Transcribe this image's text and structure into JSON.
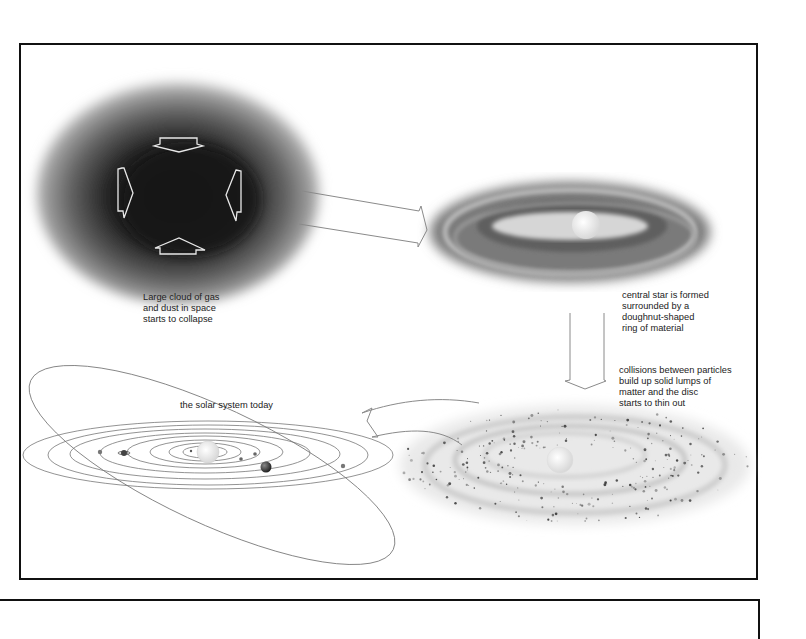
{
  "diagram": {
    "stages": [
      {
        "id": "cloud",
        "caption": "Large cloud of gas\nand dust in space\nstarts to collapse"
      },
      {
        "id": "star",
        "caption": "central star is formed\nsurrounded by a\ndoughnut-shaped\nring of material"
      },
      {
        "id": "collisions",
        "caption": "collisions between particles\nbuild up solid lumps of\nmatter and the disc\nstarts to thin out"
      },
      {
        "id": "solar",
        "caption": "the solar system today"
      }
    ],
    "arrows": [
      {
        "from": "cloud",
        "to": "star",
        "style": "straight-outline"
      },
      {
        "from": "star",
        "to": "collisions",
        "style": "vertical-outline"
      },
      {
        "from": "collisions",
        "to": "solar",
        "style": "curved-outline"
      }
    ],
    "collapse_arrows": [
      "down",
      "right",
      "left",
      "up"
    ],
    "colors": {
      "frame": "#111111",
      "arrow_outline": "#8a8a8a",
      "cloud_dark": "#151515",
      "text": "#222222"
    }
  }
}
